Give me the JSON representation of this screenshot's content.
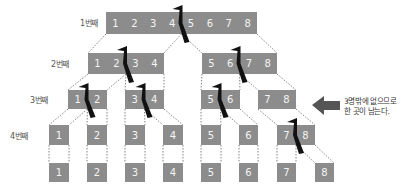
{
  "colors": {
    "box": "#8c8c8c",
    "box_text": "#f4f4f4",
    "cut_mark": "#111111",
    "arrow": "#555555",
    "connector": "#666666"
  },
  "row_labels": [
    "1번째",
    "2번째",
    "3번째",
    "4번째"
  ],
  "rows": [
    {
      "blocks": [
        {
          "cells": [
            "1",
            "2",
            "3",
            "4",
            "5",
            "6",
            "7",
            "8"
          ],
          "cut": true
        }
      ]
    },
    {
      "blocks": [
        {
          "cells": [
            "1",
            "2",
            "3",
            "4"
          ],
          "cut": true
        },
        {
          "cells": [
            "5",
            "6",
            "7",
            "8"
          ],
          "cut": true
        }
      ]
    },
    {
      "blocks": [
        {
          "cells": [
            "1",
            "2"
          ],
          "cut": true
        },
        {
          "cells": [
            "3",
            "4"
          ],
          "cut": true
        },
        {
          "cells": [
            "5",
            "6"
          ],
          "cut": true
        },
        {
          "cells": [
            "7",
            "8"
          ],
          "cut": false
        }
      ]
    },
    {
      "blocks": [
        {
          "cells": [
            "1"
          ]
        },
        {
          "cells": [
            "2"
          ]
        },
        {
          "cells": [
            "3"
          ]
        },
        {
          "cells": [
            "4"
          ]
        },
        {
          "cells": [
            "5"
          ]
        },
        {
          "cells": [
            "6"
          ]
        },
        {
          "cells": [
            "7",
            "8"
          ],
          "cut": true
        }
      ]
    },
    {
      "blocks": [
        {
          "cells": [
            "1"
          ]
        },
        {
          "cells": [
            "2"
          ]
        },
        {
          "cells": [
            "3"
          ]
        },
        {
          "cells": [
            "4"
          ]
        },
        {
          "cells": [
            "5"
          ]
        },
        {
          "cells": [
            "6"
          ]
        },
        {
          "cells": [
            "7"
          ]
        },
        {
          "cells": [
            "8"
          ]
        }
      ]
    }
  ],
  "annotation": {
    "line1": "3명밖에 없으므로",
    "line2": "한 곳이 남는다.",
    "icon": "arrow-left-icon"
  }
}
